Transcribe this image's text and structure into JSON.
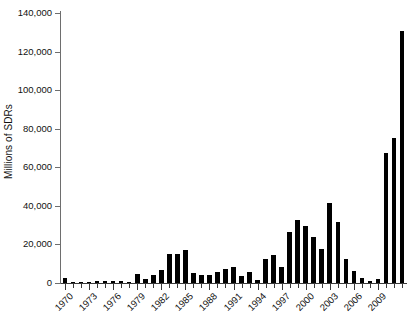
{
  "chart_data": {
    "type": "bar",
    "title": "",
    "subtitle": "",
    "xlabel": "",
    "ylabel": "Millions of SDRs",
    "ylim": [
      0,
      140000
    ],
    "ytick_labels": [
      "0",
      "20,000",
      "40,000",
      "60,000",
      "80,000",
      "100,000",
      "120,000",
      "140,000"
    ],
    "ytick_values": [
      0,
      20000,
      40000,
      60000,
      80000,
      100000,
      120000,
      140000
    ],
    "ytick_interval": 20000,
    "grid": false,
    "legend": null,
    "legend_position": "none",
    "bar_color": "#000000",
    "axis_color": "#3a3a3a",
    "xtick_label_rotation": -45,
    "xtick_label_interval": 3,
    "categories": [
      "1970",
      "1971",
      "1972",
      "1973",
      "1974",
      "1975",
      "1976",
      "1977",
      "1978",
      "1979",
      "1980",
      "1981",
      "1982",
      "1983",
      "1984",
      "1985",
      "1986",
      "1987",
      "1988",
      "1989",
      "1990",
      "1991",
      "1992",
      "1993",
      "1994",
      "1995",
      "1996",
      "1997",
      "1998",
      "1999",
      "2000",
      "2001",
      "2002",
      "2003",
      "2004",
      "2005",
      "2006",
      "2007",
      "2008",
      "2009",
      "2010",
      "2011",
      "2012"
    ],
    "xtick_labels_shown": [
      "1970",
      "1973",
      "1976",
      "1979",
      "1982",
      "1985",
      "1988",
      "1991",
      "1994",
      "1997",
      "2000",
      "2003",
      "2006",
      "2009"
    ],
    "values": [
      2400,
      700,
      400,
      300,
      1100,
      800,
      1100,
      900,
      600,
      4800,
      2000,
      4300,
      6700,
      14900,
      15100,
      17300,
      5200,
      3900,
      4100,
      5800,
      7400,
      8500,
      3700,
      5600,
      1400,
      12200,
      14300,
      8100,
      26700,
      32800,
      29600,
      23900,
      17600,
      41600,
      31800,
      12500,
      6100,
      2600,
      1000,
      2200,
      67300,
      75000,
      130600
    ]
  }
}
